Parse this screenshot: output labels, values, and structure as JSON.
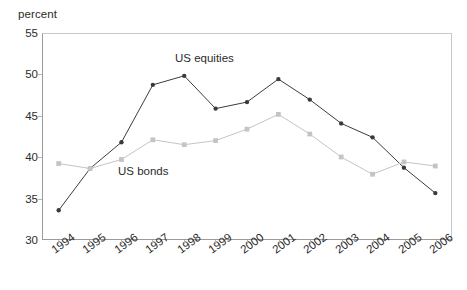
{
  "chart_data": {
    "type": "line",
    "title": "",
    "subtitle": "",
    "xlabel": "",
    "ylabel": "percent",
    "unit_label": "percent",
    "categories": [
      "1994",
      "1995",
      "1996",
      "1997",
      "1998",
      "1999",
      "2000",
      "2001",
      "2002",
      "2003",
      "2004",
      "2005",
      "2006"
    ],
    "x": [
      1994,
      1995,
      1996,
      1997,
      1998,
      1999,
      2000,
      2001,
      2002,
      2003,
      2004,
      2005,
      2006
    ],
    "ylim": [
      30,
      55
    ],
    "yticks": [
      30,
      35,
      40,
      45,
      50,
      55
    ],
    "ytick_labels": [
      "30",
      "35",
      "40",
      "45",
      "50",
      "55"
    ],
    "grid": false,
    "legend_position": "inline-annotations",
    "series": [
      {
        "name": "US equities",
        "color": "#3a3a3a",
        "marker": "circle",
        "values": [
          33.5,
          38.6,
          41.8,
          48.8,
          49.9,
          45.9,
          46.7,
          49.5,
          47.0,
          44.1,
          42.4,
          38.7,
          35.6
        ]
      },
      {
        "name": "US bonds",
        "color": "#c4c4c4",
        "marker": "square",
        "values": [
          39.2,
          38.6,
          39.7,
          42.1,
          41.5,
          42.0,
          43.4,
          45.2,
          42.8,
          40.0,
          37.9,
          39.4,
          38.9
        ]
      }
    ],
    "annotations": [
      {
        "text": "US equities",
        "series": "US equities"
      },
      {
        "text": "US bonds",
        "series": "US bonds"
      }
    ]
  },
  "colors": {
    "equities": "#3a3a3a",
    "bonds": "#c4c4c4",
    "axis": "#9a9a9a",
    "frame_light": "#c9c9c9",
    "text": "#2b2b2b",
    "background": "#ffffff"
  }
}
